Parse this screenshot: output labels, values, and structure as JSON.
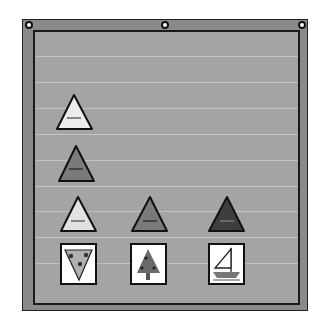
{
  "pocket_chart": {
    "board_color": "#8a8a8a",
    "panel_color": "#a4a4a4",
    "border_color": "#1a1a1a",
    "grommets": [
      {
        "name": "grommet-left",
        "x": 29,
        "y": 25
      },
      {
        "name": "grommet-center",
        "x": 165,
        "y": 25
      },
      {
        "name": "grommet-right",
        "x": 302,
        "y": 25
      }
    ],
    "pocket_lines_y": [
      56,
      82,
      108,
      134,
      160,
      186,
      211,
      237,
      263
    ],
    "triangles": [
      {
        "name": "light-triangle-row1",
        "row": 1,
        "col": 1,
        "apex": [
          74,
          95
        ],
        "base_y": 129,
        "base_x": [
          57,
          92
        ],
        "fill": "#ececec"
      },
      {
        "name": "medium-triangle-row2",
        "row": 2,
        "col": 1,
        "apex": [
          76,
          146
        ],
        "base_y": 181,
        "base_x": [
          59,
          94
        ],
        "fill": "#7a7a7a"
      },
      {
        "name": "light-triangle-row3",
        "row": 3,
        "col": 1,
        "apex": [
          78,
          197
        ],
        "base_y": 231,
        "base_x": [
          61,
          96
        ],
        "fill": "#e2e2e2"
      },
      {
        "name": "medium-triangle-row3",
        "row": 3,
        "col": 2,
        "apex": [
          150,
          197
        ],
        "base_y": 231,
        "base_x": [
          132,
          167
        ],
        "fill": "#7a7a7a"
      },
      {
        "name": "dark-triangle-row3",
        "row": 3,
        "col": 3,
        "apex": [
          227,
          197
        ],
        "base_y": 231,
        "base_x": [
          209,
          244
        ],
        "fill": "#3e3e3e"
      }
    ],
    "picture_cards": [
      {
        "name": "pizza-card",
        "icon": "pizza-slice-icon",
        "x": 61,
        "y": 244,
        "w": 35,
        "h": 40
      },
      {
        "name": "tree-card",
        "icon": "pine-tree-icon",
        "x": 131,
        "y": 244,
        "w": 35,
        "h": 40
      },
      {
        "name": "sailboat-card",
        "icon": "sailboat-icon",
        "x": 209,
        "y": 244,
        "w": 35,
        "h": 40
      }
    ]
  }
}
